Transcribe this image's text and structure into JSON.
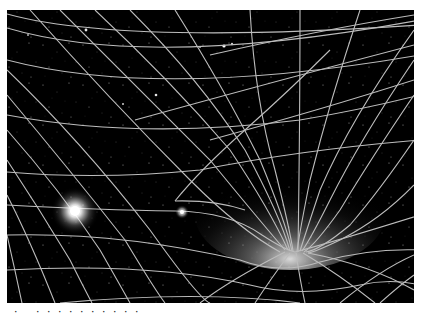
{
  "figure": {
    "background_color": "#000000",
    "grid_color": "#bdbdbd",
    "elements": [
      {
        "name": "bright-star",
        "cx": 68,
        "cy": 201,
        "glow_radius": 22
      },
      {
        "name": "small-star",
        "cx": 175,
        "cy": 201,
        "glow_radius": 6
      },
      {
        "name": "gravity-well",
        "cx": 290,
        "cy": 252
      }
    ]
  },
  "caption": {
    "text": "· . ·  ·  ·  ·  ·   ·   ·   ·  ·  ·",
    "note": "cropped, illegible"
  }
}
